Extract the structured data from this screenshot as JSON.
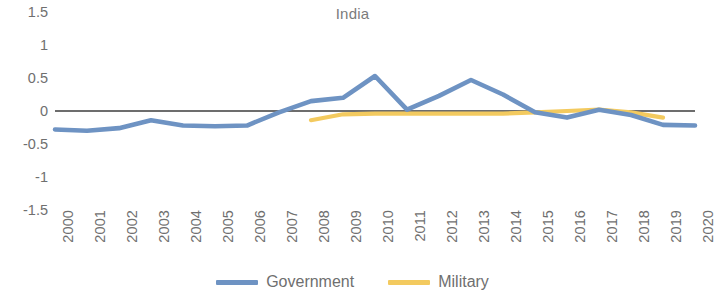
{
  "chart_data": {
    "type": "line",
    "title": "India",
    "xlabel": "",
    "ylabel": "",
    "ylim": [
      -1.5,
      1.5
    ],
    "yticks": [
      "1.5",
      "1",
      "0.5",
      "0",
      "-0.5",
      "-1",
      "-1.5"
    ],
    "ytick_values": [
      1.5,
      1,
      0.5,
      0,
      -0.5,
      -1,
      -1.5
    ],
    "grid": false,
    "zero_line": true,
    "legend_position": "bottom",
    "categories": [
      "2000",
      "2001",
      "2002",
      "2003",
      "2004",
      "2005",
      "2006",
      "2007",
      "2008",
      "2009",
      "2010",
      "2011",
      "2012",
      "2013",
      "2014",
      "2015",
      "2016",
      "2017",
      "2018",
      "2019",
      "2020"
    ],
    "x": [
      2000,
      2001,
      2002,
      2003,
      2004,
      2005,
      2006,
      2007,
      2008,
      2009,
      2010,
      2011,
      2012,
      2013,
      2014,
      2015,
      2016,
      2017,
      2018,
      2019,
      2020
    ],
    "series": [
      {
        "name": "Government",
        "color": "#6e93c3",
        "x": [
          2000,
          2001,
          2002,
          2003,
          2004,
          2005,
          2006,
          2007,
          2008,
          2009,
          2010,
          2011,
          2012,
          2013,
          2014,
          2015,
          2016,
          2017,
          2018,
          2019,
          2020
        ],
        "values": [
          -0.28,
          -0.3,
          -0.26,
          -0.14,
          -0.22,
          -0.23,
          -0.22,
          -0.02,
          0.15,
          0.2,
          0.53,
          0.02,
          0.23,
          0.47,
          0.25,
          -0.02,
          -0.1,
          0.02,
          -0.06,
          -0.21,
          -0.22
        ]
      },
      {
        "name": "Military",
        "color": "#f3ca5f",
        "x": [
          2008,
          2009,
          2010,
          2011,
          2012,
          2013,
          2014,
          2015,
          2016,
          2017,
          2018,
          2019
        ],
        "values": [
          -0.14,
          -0.05,
          -0.04,
          -0.04,
          -0.04,
          -0.04,
          -0.04,
          -0.02,
          0.0,
          0.02,
          -0.02,
          -0.1
        ]
      }
    ]
  },
  "legend": {
    "items": [
      {
        "label": "Government",
        "color": "#6e93c3"
      },
      {
        "label": "Military",
        "color": "#f3ca5f"
      }
    ]
  }
}
